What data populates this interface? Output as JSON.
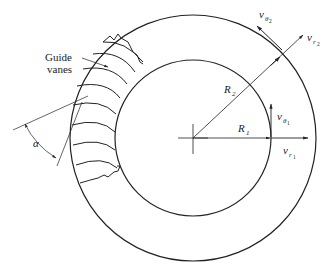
{
  "figure": {
    "type": "engineering-diagram",
    "stroke_color": "#222222",
    "background": "#ffffff"
  },
  "labels": {
    "guide_vanes_line1": "Guide",
    "guide_vanes_line2": "vanes",
    "alpha": "α",
    "R2": "R",
    "R2_sub": "2",
    "R1": "R",
    "R1_sub": "1",
    "v_theta2": "v",
    "v_theta2_sub": "θ",
    "v_theta2_subsub": "2",
    "v_r2": "v",
    "v_r2_sub": "r",
    "v_r2_subsub": "2",
    "v_theta1": "v",
    "v_theta1_sub": "θ",
    "v_theta1_subsub": "1",
    "v_r1": "v",
    "v_r1_sub": "r",
    "v_r1_subsub": "1"
  }
}
